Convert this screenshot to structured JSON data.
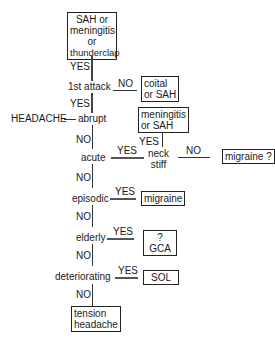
{
  "nodes": {
    "top_box": [
      "SAH or",
      "meningitis",
      "or",
      "thunderclap"
    ],
    "first_attack": "1st attack",
    "coital_box": [
      "coital",
      "or SAH"
    ],
    "headache": "HEADACHE",
    "abrupt": "abrupt",
    "meningitis_box": [
      "meningitis",
      "or SAH"
    ],
    "acute": "acute",
    "neck_stiff": [
      "neck",
      "stiff"
    ],
    "migraine_q_box": "migraine ?",
    "episodic": "episodic",
    "migraine_box": "migraine",
    "elderly": "elderly",
    "gca_box": "? GCA",
    "deteriorating": "deteriorating",
    "sol_box": "SOL",
    "tension_box": [
      "tension",
      "headache"
    ]
  },
  "labels": {
    "yes": "YES",
    "no": "NO"
  }
}
